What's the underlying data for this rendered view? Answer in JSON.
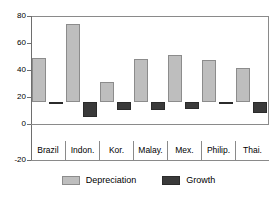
{
  "chart_data": {
    "type": "bar",
    "title": "",
    "subtitle": "",
    "xlabel": "",
    "ylabel": "",
    "ylim": [
      -20,
      80
    ],
    "yticks": [
      80,
      60,
      40,
      20,
      0,
      -20
    ],
    "ytick_labels": [
      "80",
      "60",
      "40",
      "20",
      "0",
      "-20"
    ],
    "grid": false,
    "legend_position": "bottom",
    "categories": [
      "Brazil",
      "Indon.",
      "Kor.",
      "Malay.",
      "Mex.",
      "Philip.",
      "Thai."
    ],
    "series": [
      {
        "name": "Depreciation",
        "color": "#bebebe",
        "values": [
          41.5,
          73,
          18.5,
          40,
          44,
          39,
          32
        ]
      },
      {
        "name": "Growth",
        "color": "#3a3a3a",
        "values": [
          0.8,
          -13.5,
          -7,
          -7,
          -6.5,
          -0.6,
          -10
        ]
      }
    ]
  },
  "legend": {
    "items": [
      {
        "label": "Depreciation",
        "color": "#bebebe",
        "swatch": "legend-swatch-depreciation"
      },
      {
        "label": "Growth",
        "color": "#3a3a3a",
        "swatch": "legend-swatch-growth"
      }
    ]
  },
  "axis": {
    "zero_label": "0"
  }
}
